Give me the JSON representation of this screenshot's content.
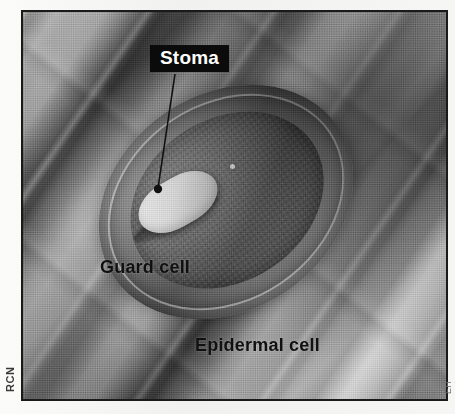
{
  "figure": {
    "kind": "scanning-electron-micrograph",
    "frame_border_color": "#1a1a1a",
    "page_background_color": "#f4f4f3"
  },
  "labels": {
    "stoma": {
      "text": "Stoma",
      "style": "white-bold-on-black-box",
      "text_color": "#ffffff",
      "box_color": "#0b0b0b",
      "has_leader_line": true
    },
    "guard_cell": {
      "text": "Guard cell",
      "style": "black-bold-no-box",
      "text_color": "#101010"
    },
    "epidermal_cell": {
      "text": "Epidermal cell",
      "style": "black-bold-no-box",
      "text_color": "#101010"
    }
  },
  "leader_line": {
    "color": "#111111",
    "start": {
      "x": 152,
      "y": 62
    },
    "end": {
      "x": 135,
      "y": 178
    },
    "end_dot_radius": 4
  },
  "credits": {
    "left_margin": "RCN",
    "right_margin": "EH"
  }
}
